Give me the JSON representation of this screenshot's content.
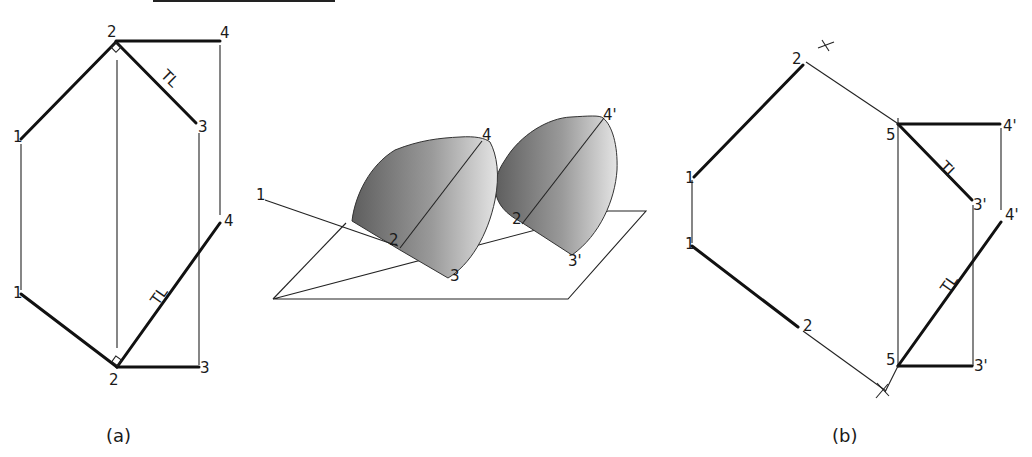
{
  "figure": {
    "top_rule": true,
    "panel_a": {
      "caption": "(a)",
      "labels": {
        "p2_top": "2",
        "p4_top": "4",
        "p1_upper": "1",
        "p3_upper": "3",
        "tl_upper": "TL",
        "p4_lower": "4",
        "p1_lower": "1",
        "p2_lower": "2",
        "p3_lower": "3",
        "tl_lower": "TL"
      }
    },
    "pictorial": {
      "labels": {
        "p1": "1",
        "p2": "2",
        "p3": "3",
        "p4": "4",
        "p2_prime": "2",
        "p3_prime": "3'",
        "p4_prime": "4'"
      },
      "fill_dark": "#6e6e6e",
      "fill_light": "#d8d8d8"
    },
    "panel_b": {
      "caption": "(b)",
      "labels": {
        "p2_top": "2",
        "p1_upper": "1",
        "p5_upper": "5",
        "p4p_upper": "4'",
        "p3p_upper": "3'",
        "tl_upper": "TL",
        "p4p_lower": "4'",
        "p1_lower": "1",
        "p2_lower": "2",
        "p5_lower": "5",
        "p3p_lower": "3'",
        "tl_lower": "TL"
      }
    }
  }
}
